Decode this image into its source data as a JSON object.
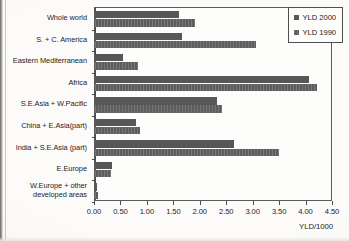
{
  "chart_data": {
    "type": "bar",
    "orientation": "horizontal",
    "title": "",
    "xlabel": "YLD/1000",
    "ylabel": "",
    "xlim": [
      0.0,
      4.5
    ],
    "xticks": [
      "0.00",
      "0.50",
      "1.00",
      "1.50",
      "2.00",
      "2.50",
      "3.00",
      "3.50",
      "4.00",
      "4.50"
    ],
    "xtick_values": [
      0.0,
      0.5,
      1.0,
      1.5,
      2.0,
      2.5,
      3.0,
      3.5,
      4.0,
      4.5
    ],
    "grid": false,
    "legend_position": "top-right",
    "categories": [
      "Whole world",
      "S. + C. America",
      "Eastern Mediterranean",
      "Africa",
      "S.E.Asia + W.Pacific",
      "China + E.Asia(part)",
      "India + S.E.Asia (part)",
      "E.Europe",
      "W.Europe + other\ndeveloped areas"
    ],
    "series": [
      {
        "name": "YLD 2000",
        "color": "#575757",
        "values": [
          1.58,
          1.65,
          0.53,
          4.05,
          2.3,
          0.78,
          2.62,
          0.32,
          0.03
        ]
      },
      {
        "name": "YLD 1990",
        "color": "#5d5d5d",
        "values": [
          1.9,
          3.05,
          0.82,
          4.2,
          2.4,
          0.85,
          3.48,
          0.3,
          0.05
        ]
      }
    ]
  },
  "legend": {
    "items": [
      {
        "label": "YLD 2000"
      },
      {
        "label": "YLD 1990"
      }
    ]
  }
}
